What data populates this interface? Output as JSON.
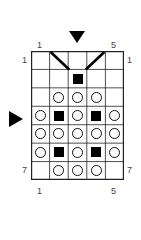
{
  "chart": {
    "title": "",
    "columns": 5,
    "rows": 7,
    "top_labels": {
      "left": "1",
      "right": "5"
    },
    "bottom_labels": {
      "left": "1",
      "right": "5"
    },
    "left_labels": {
      "top": "1",
      "bottom": "7"
    },
    "right_labels": {
      "top": "1",
      "bottom": "7"
    },
    "markers": {
      "top_arrow": {
        "direction": "down",
        "column": 3
      },
      "side_arrow": {
        "direction": "right",
        "row": 4
      }
    },
    "grid": [
      [
        "empty",
        "diag-left",
        "empty",
        "diag-right",
        "empty"
      ],
      [
        "empty",
        "empty",
        "square",
        "empty",
        "empty"
      ],
      [
        "empty",
        "circle",
        "circle",
        "circle",
        "empty"
      ],
      [
        "circle",
        "square",
        "circle",
        "square",
        "circle"
      ],
      [
        "circle",
        "circle",
        "circle",
        "circle",
        "circle"
      ],
      [
        "circle",
        "square",
        "circle",
        "square",
        "circle"
      ],
      [
        "empty",
        "circle",
        "circle",
        "circle",
        "empty"
      ]
    ],
    "colors": {
      "line": "#111111",
      "fill": "#000000",
      "background": "#ffffff"
    }
  }
}
